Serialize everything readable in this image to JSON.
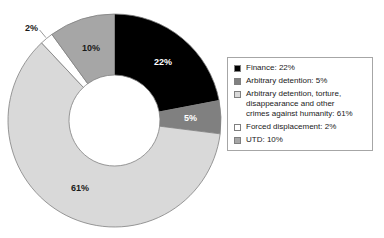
{
  "chart_data": {
    "type": "pie",
    "variant": "donut",
    "title": "",
    "subtitle": "",
    "xlabel": "",
    "ylabel": "",
    "grid": false,
    "legend_position": "right",
    "units": "percent",
    "total": 100,
    "start_angle_deg": 0,
    "direction": "clockwise",
    "categories": [
      "Finance",
      "Arbitrary detention",
      "Arbitrary detention, torture, disappearance and other crimes against humanity",
      "Forced displacement",
      "UTD"
    ],
    "values": [
      22,
      5,
      61,
      2,
      10
    ],
    "data_labels": [
      "22%",
      "5%",
      "61%",
      "2%",
      "10%"
    ],
    "colors": [
      "#000000",
      "#808080",
      "#d9d9d9",
      "#ffffff",
      "#a6a6a6"
    ],
    "slice_label_colors": [
      "light",
      "light",
      "dark",
      "dark",
      "dark"
    ]
  },
  "chart": {
    "slices": [
      {
        "name": "Finance",
        "value": 22,
        "label": "22%",
        "color": "#000000",
        "label_color": "light"
      },
      {
        "name": "Arbitrary detention",
        "value": 5,
        "label": "5%",
        "color": "#808080",
        "label_color": "light"
      },
      {
        "name": "Arbitrary detention, torture, disappearance and other crimes against humanity",
        "value": 61,
        "label": "61%",
        "color": "#d9d9d9",
        "label_color": "dark"
      },
      {
        "name": "Forced displacement",
        "value": 2,
        "label": "2%",
        "color": "#ffffff",
        "label_color": "dark"
      },
      {
        "name": "UTD",
        "value": 10,
        "label": "10%",
        "color": "#a6a6a6",
        "label_color": "dark"
      }
    ],
    "labels": {
      "finance": "22%",
      "arbitrary_detention": "5%",
      "crimes_against_humanity": "61%",
      "forced_displacement": "2%",
      "utd": "10%"
    }
  },
  "legend": {
    "items": [
      {
        "swatch": "#000000",
        "text": "Finance: 22%"
      },
      {
        "swatch": "#808080",
        "text": "Arbitrary detention: 5%"
      },
      {
        "swatch": "#d9d9d9",
        "text": "Arbitrary detention, torture,\ndisappearance and other\ncrimes against humanity: 61%"
      },
      {
        "swatch": "#ffffff",
        "text": "Forced displacement: 2%"
      },
      {
        "swatch": "#a6a6a6",
        "text": "UTD: 10%"
      }
    ]
  }
}
